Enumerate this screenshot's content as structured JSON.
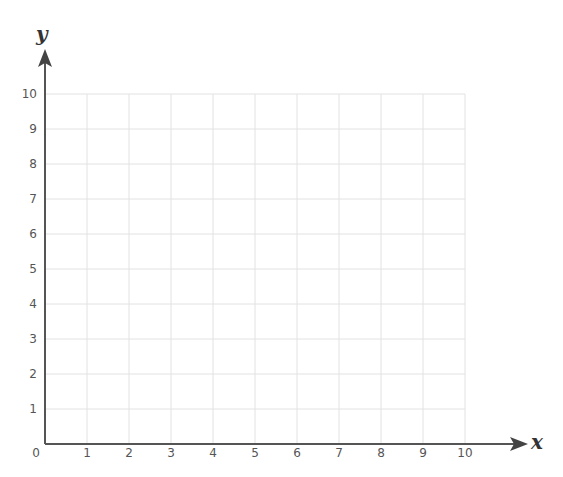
{
  "chart_data": {
    "type": "scatter",
    "title": "",
    "xlabel": "x",
    "ylabel": "y",
    "xlim": [
      0,
      10
    ],
    "ylim": [
      0,
      10
    ],
    "x_ticks": [
      "0",
      "1",
      "2",
      "3",
      "4",
      "5",
      "6",
      "7",
      "8",
      "9",
      "10"
    ],
    "y_ticks": [
      "1",
      "2",
      "3",
      "4",
      "5",
      "6",
      "7",
      "8",
      "9",
      "10"
    ],
    "grid": true,
    "series": [],
    "legend": null
  },
  "colors": {
    "axis": "#555555",
    "grid": "#e2e2e2",
    "label": "#333333"
  }
}
